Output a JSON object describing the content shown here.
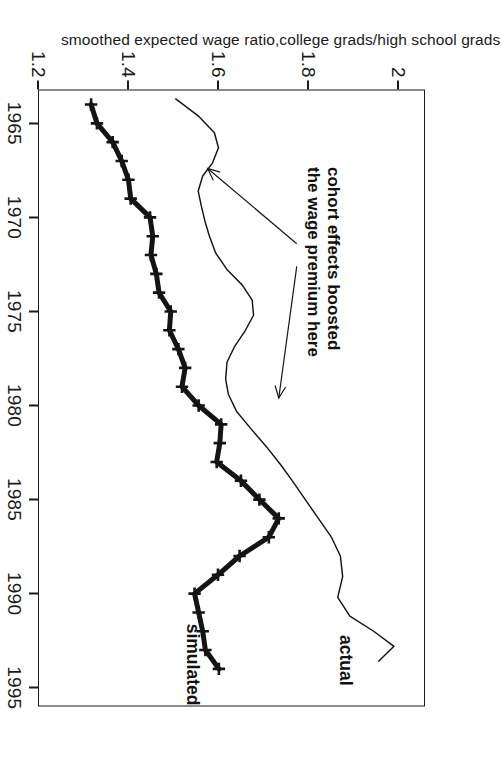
{
  "figure": {
    "background": "#ffffff",
    "ink": "#1a1a1a",
    "rotation_note": "page scanned rotated 90 degrees"
  },
  "axes": {
    "x_title": "Year",
    "y_title": "smoothed expected wage ratio,college grads/high school grads",
    "x_ticks": [
      "1965",
      "1970",
      "1975",
      "1980",
      "1985",
      "1990",
      "1995"
    ],
    "y_ticks": [
      "1.2",
      "1.4",
      "1.6",
      "1.8",
      "2"
    ]
  },
  "labels": {
    "actual": "actual",
    "simulated": "simulated",
    "annotation_line1": "cohort effects boosted",
    "annotation_line2": "the wage premium here"
  },
  "chart_data": {
    "type": "line",
    "title": "",
    "xlabel": "Year",
    "ylabel": "smoothed expected wage ratio,college grads/high school grads",
    "xlim": [
      1963.2,
      1996.0
    ],
    "ylim": [
      1.2,
      2.06
    ],
    "xticks": [
      1965,
      1970,
      1975,
      1980,
      1985,
      1990,
      1995
    ],
    "yticks": [
      1.2,
      1.4,
      1.6,
      1.8,
      2.0
    ],
    "grid": false,
    "legend": "inline-labels",
    "annotations": [
      {
        "text": "cohort effects boosted the wage premium here",
        "x": 1972.0,
        "y": 1.83,
        "arrows": [
          {
            "from_x": 1972.6,
            "from_y": 1.775,
            "to_x": 1979.6,
            "to_y": 1.735
          },
          {
            "from_x": 1971.4,
            "from_y": 1.775,
            "to_x": 1967.4,
            "to_y": 1.577
          }
        ]
      },
      {
        "text": "actual",
        "x": 1992.2,
        "y": 1.885
      },
      {
        "text": "simulated",
        "x": 1991.6,
        "y": 1.545
      }
    ],
    "series": [
      {
        "name": "actual",
        "style": "thin-line",
        "linewidth": 1,
        "marker": "none",
        "x": [
          1963.7,
          1964.6,
          1965.5,
          1966.3,
          1967.1,
          1967.8,
          1968.6,
          1969.4,
          1970.2,
          1971.0,
          1971.9,
          1972.8,
          1973.6,
          1974.4,
          1975.2,
          1976.0,
          1976.9,
          1977.7,
          1978.6,
          1979.4,
          1980.3,
          1981.2,
          1982.2,
          1983.2,
          1984.1,
          1985.0,
          1986.0,
          1987.0,
          1988.0,
          1989.1,
          1990.2,
          1991.2,
          1992.0,
          1992.8,
          1993.6
        ],
        "y": [
          1.506,
          1.556,
          1.592,
          1.601,
          1.588,
          1.566,
          1.556,
          1.563,
          1.571,
          1.581,
          1.595,
          1.621,
          1.654,
          1.676,
          1.679,
          1.661,
          1.636,
          1.62,
          1.617,
          1.623,
          1.641,
          1.672,
          1.708,
          1.741,
          1.768,
          1.794,
          1.823,
          1.852,
          1.872,
          1.877,
          1.866,
          1.893,
          1.946,
          1.991,
          1.957
        ]
      },
      {
        "name": "simulated",
        "style": "thick-line-with-plus-markers",
        "linewidth": 5,
        "marker": "plus",
        "x": [
          1964.0,
          1965.0,
          1966.0,
          1967.0,
          1968.0,
          1969.0,
          1970.0,
          1971.0,
          1972.0,
          1973.0,
          1974.0,
          1975.0,
          1976.0,
          1977.0,
          1978.0,
          1979.0,
          1980.0,
          1981.0,
          1982.0,
          1983.0,
          1984.0,
          1985.0,
          1986.0,
          1987.0,
          1988.0,
          1989.0,
          1990.0,
          1991.0,
          1992.0,
          1993.0,
          1994.0
        ],
        "y": [
          1.318,
          1.331,
          1.366,
          1.386,
          1.401,
          1.406,
          1.449,
          1.455,
          1.451,
          1.463,
          1.469,
          1.495,
          1.492,
          1.512,
          1.527,
          1.52,
          1.557,
          1.607,
          1.604,
          1.597,
          1.651,
          1.692,
          1.735,
          1.713,
          1.648,
          1.6,
          1.548,
          1.557,
          1.566,
          1.572,
          1.602
        ]
      }
    ]
  }
}
